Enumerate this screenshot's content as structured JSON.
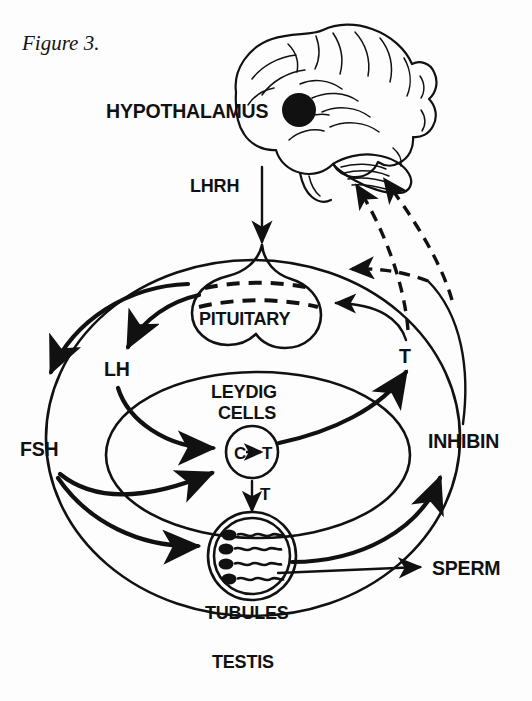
{
  "figure": {
    "caption": "Figure 3.",
    "title_implicit": "Hypothalamic-pituitary-testicular axis"
  },
  "labels": {
    "hypothalamus": "HYPOTHALAMUS",
    "lhrh": "LHRH",
    "pituitary": "PITUITARY",
    "lh": "LH",
    "fsh": "FSH",
    "leydig_line1": "LEYDIG",
    "leydig_line2": "CELLS",
    "conversion_c": "C",
    "conversion_arrow": "→",
    "conversion_t": "T",
    "testosterone_to_tubules": "T",
    "testosterone_feedback": "T",
    "inhibin": "INHIBIN",
    "tubules": "TUBULES",
    "testis": "TESTIS",
    "sperm": "SPERM"
  },
  "icons": {
    "brain": "brain-icon",
    "hypothalamus_dot": "hypothalamus-dot-icon",
    "pituitary_gland": "pituitary-gland-icon",
    "leydig_cell": "leydig-cell-icon",
    "seminiferous_tubule": "tubule-icon",
    "spermatozoa": "sperm-cells-icon"
  },
  "colors": {
    "ink": "#111111",
    "paper": "#fdfdfd"
  },
  "diagram": {
    "type": "flowchart",
    "nodes": [
      {
        "id": "hypothalamus",
        "label": "HYPOTHALAMUS"
      },
      {
        "id": "pituitary",
        "label": "PITUITARY"
      },
      {
        "id": "leydig",
        "label": "LEYDIG CELLS"
      },
      {
        "id": "tubules",
        "label": "TUBULES"
      },
      {
        "id": "testis",
        "label": "TESTIS"
      },
      {
        "id": "sperm",
        "label": "SPERM"
      }
    ],
    "edges": [
      {
        "from": "hypothalamus",
        "to": "pituitary",
        "label": "LHRH",
        "style": "solid"
      },
      {
        "from": "pituitary",
        "to": "leydig",
        "label": "LH",
        "style": "solid"
      },
      {
        "from": "pituitary",
        "to": "tubules",
        "label": "FSH",
        "style": "solid"
      },
      {
        "from": "pituitary",
        "to": "leydig",
        "label": "FSH",
        "style": "solid"
      },
      {
        "from": "leydig",
        "to": "tubules",
        "label": "T",
        "style": "solid"
      },
      {
        "from": "leydig",
        "to": "pituitary",
        "label": "T",
        "style": "solid"
      },
      {
        "from": "tubules",
        "to": "inhibin",
        "label": "INHIBIN",
        "style": "solid"
      },
      {
        "from": "inhibin",
        "to": "hypothalamus",
        "label": "",
        "style": "dashed"
      },
      {
        "from": "testosterone",
        "to": "hypothalamus",
        "label": "",
        "style": "dashed"
      },
      {
        "from": "tubules",
        "to": "sperm",
        "label": "SPERM",
        "style": "solid"
      }
    ],
    "sperm_count": 4,
    "sperm_cells": [
      1,
      2,
      3,
      4
    ]
  }
}
